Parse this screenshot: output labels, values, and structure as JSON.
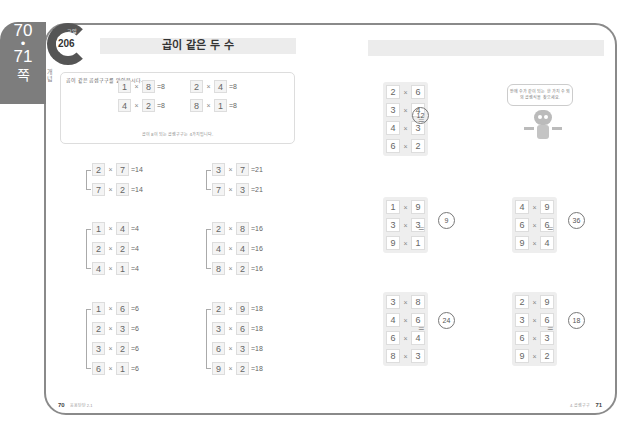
{
  "side_tab": {
    "page_a": "70",
    "dot": "•",
    "page_b": "71",
    "suffix": "쪽"
  },
  "logo": {
    "tag": "교일",
    "number": "206"
  },
  "title": "곱이 같은 두 수",
  "side_label": "개념",
  "concept": {
    "question": "곱이 같은 곱셈구구를 알아봅시다.",
    "equations": [
      {
        "a": "1",
        "b": "8",
        "result": "=8"
      },
      {
        "a": "2",
        "b": "4",
        "result": "=8"
      },
      {
        "a": "4",
        "b": "2",
        "result": "=8"
      },
      {
        "a": "8",
        "b": "1",
        "result": "=8"
      }
    ],
    "note": "곱이 8이 되는 곱셈구구는 4가지입니다."
  },
  "left_groups": [
    {
      "items": [
        {
          "a": "2",
          "b": "7",
          "result": "=14"
        },
        {
          "a": "7",
          "b": "2",
          "result": "=14"
        }
      ]
    },
    {
      "items": [
        {
          "a": "3",
          "b": "7",
          "result": "=21"
        },
        {
          "a": "7",
          "b": "3",
          "result": "=21"
        }
      ]
    },
    {
      "items": [
        {
          "a": "1",
          "b": "4",
          "result": "=4"
        },
        {
          "a": "2",
          "b": "2",
          "result": "=4"
        },
        {
          "a": "4",
          "b": "1",
          "result": "=4"
        }
      ]
    },
    {
      "items": [
        {
          "a": "2",
          "b": "8",
          "result": "=16"
        },
        {
          "a": "4",
          "b": "4",
          "result": "=16"
        },
        {
          "a": "8",
          "b": "2",
          "result": "=16"
        }
      ]
    },
    {
      "items": [
        {
          "a": "1",
          "b": "6",
          "result": "=6"
        },
        {
          "a": "2",
          "b": "3",
          "result": "=6"
        },
        {
          "a": "3",
          "b": "2",
          "result": "=6"
        },
        {
          "a": "6",
          "b": "1",
          "result": "=6"
        }
      ]
    },
    {
      "items": [
        {
          "a": "2",
          "b": "9",
          "result": "=18"
        },
        {
          "a": "3",
          "b": "6",
          "result": "=18"
        },
        {
          "a": "6",
          "b": "3",
          "result": "=18"
        },
        {
          "a": "9",
          "b": "2",
          "result": "=18"
        }
      ]
    }
  ],
  "right_groups": [
    {
      "items": [
        {
          "a": "2",
          "b": "6"
        },
        {
          "a": "3",
          "b": "4"
        },
        {
          "a": "4",
          "b": "3"
        },
        {
          "a": "6",
          "b": "2"
        }
      ],
      "answer": "12"
    },
    {
      "items": [
        {
          "a": "1",
          "b": "9"
        },
        {
          "a": "3",
          "b": "3"
        },
        {
          "a": "9",
          "b": "1"
        }
      ],
      "answer": "9"
    },
    {
      "items": [
        {
          "a": "4",
          "b": "9"
        },
        {
          "a": "6",
          "b": "6"
        },
        {
          "a": "9",
          "b": "4"
        }
      ],
      "answer": "36"
    },
    {
      "items": [
        {
          "a": "3",
          "b": "8"
        },
        {
          "a": "4",
          "b": "6"
        },
        {
          "a": "6",
          "b": "4"
        },
        {
          "a": "8",
          "b": "3"
        }
      ],
      "answer": "24"
    },
    {
      "items": [
        {
          "a": "2",
          "b": "9"
        },
        {
          "a": "3",
          "b": "6"
        },
        {
          "a": "6",
          "b": "3"
        },
        {
          "a": "9",
          "b": "2"
        }
      ],
      "answer": "18"
    }
  ],
  "times": "×",
  "equals": "=",
  "bubble": "안에 수가 같이 되는 한 가지 수 외의 곱셈식을 찾으세요.",
  "footer": {
    "left_page": "70",
    "left_label": "응용탄탄 2-1",
    "right_label": "4. 곱셈구구",
    "right_page": "71"
  }
}
